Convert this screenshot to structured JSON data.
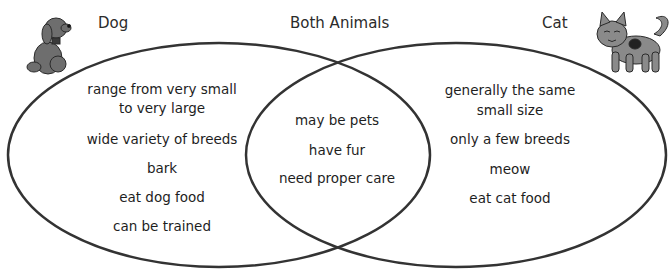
{
  "diagram": {
    "type": "venn",
    "left": {
      "title": "Dog",
      "icon": "dog-icon",
      "items": [
        "range from very small\nto very large",
        "wide variety of breeds",
        "bark",
        "eat dog food",
        "can be trained"
      ]
    },
    "center": {
      "title": "Both Animals",
      "items": [
        "may be pets",
        "have fur",
        "need proper care"
      ]
    },
    "right": {
      "title": "Cat",
      "icon": "cat-icon",
      "items": [
        "generally the same\nsmall size",
        "only a few breeds",
        "meow",
        "eat cat food"
      ]
    },
    "colors": {
      "outline": "#333333",
      "animal_fill": "#6e6e6e",
      "text": "#1e1e1e"
    }
  }
}
